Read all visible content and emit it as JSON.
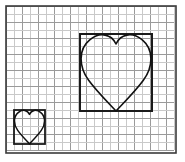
{
  "figure": {
    "kind": "grid-diagram",
    "width": 185,
    "height": 162,
    "background_color": "#ffffff"
  },
  "colors": {
    "grid_line": "#9a9a9a",
    "grid_line_light": "#c9c9c9",
    "outer_border": "#3a3a3a",
    "box_stroke": "#1a1a1a",
    "heart_stroke": "#111111",
    "paper": "#ffffff"
  },
  "grid": {
    "cell_size": 8,
    "origin_x": 6,
    "origin_y": 6,
    "columns": 21,
    "rows": 18,
    "line_width": 1,
    "visible": true
  },
  "outer_border": {
    "label": "graph-paper-edge",
    "x": 6,
    "y": 6,
    "width": 170,
    "height": 147,
    "stroke_width": 1.6
  },
  "shapes": [
    {
      "id": "small-heart",
      "label": "Small heart",
      "box_label": "Small bounding box",
      "box": {
        "x": 14,
        "y": 110,
        "width": 31,
        "height": 34
      },
      "cells_wide": 4,
      "cells_tall": 4,
      "stroke_width": 1.5,
      "box_stroke_width": 1.8
    },
    {
      "id": "large-heart",
      "label": "Large heart",
      "box_label": "Large bounding box",
      "box": {
        "x": 80,
        "y": 34,
        "width": 72,
        "height": 77
      },
      "cells_wide": 9,
      "cells_tall": 9,
      "stroke_width": 1.6,
      "box_stroke_width": 2.0
    }
  ],
  "annotations": {
    "scale_factor_text": "",
    "caption": ""
  }
}
